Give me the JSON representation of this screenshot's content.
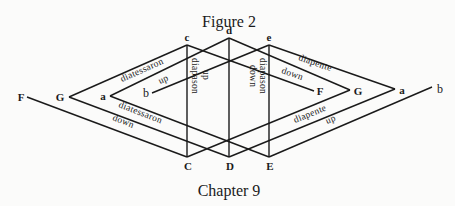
{
  "title": "Figure 2",
  "footer": "Chapter 9",
  "nodes": {
    "top": [
      "c",
      "d",
      "e"
    ],
    "bottom": [
      "C",
      "D",
      "E"
    ],
    "left": [
      "F",
      "G",
      "a",
      "b"
    ],
    "right": [
      "F",
      "G",
      "a",
      "b"
    ]
  },
  "labels": {
    "diatessaron_up_interval": "diatessaron",
    "diatessaron_up_dir": "up",
    "diatessaron_down_interval": "diatessaron",
    "diatessaron_down_dir": "down",
    "diapason_up_interval": "diapason",
    "diapason_up_dir": "up",
    "diapason_down_interval": "diapason",
    "diapason_down_dir": "down",
    "diapente_down_interval": "diapente",
    "diapente_down_dir": "down",
    "diapente_up_interval": "diapente",
    "diapente_up_dir": "up"
  }
}
